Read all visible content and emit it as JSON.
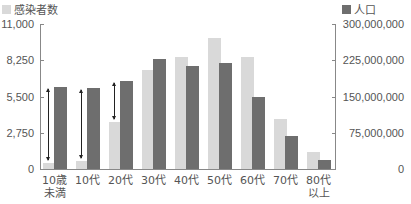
{
  "chart_data": {
    "type": "bar",
    "title": "",
    "xlabel": "",
    "ylabel_left": "",
    "ylabel_right": "",
    "categories": [
      "10歳\n未満",
      "10代",
      "20代",
      "30代",
      "40代",
      "50代",
      "60代",
      "70代",
      "80代\n以上"
    ],
    "series": [
      {
        "name": "感染者数",
        "axis": "left",
        "color": "#d9d9d9",
        "values": [
          450,
          600,
          3550,
          7500,
          8500,
          9950,
          8500,
          3800,
          1300
        ]
      },
      {
        "name": "人口",
        "axis": "right",
        "color": "#6e6e6e",
        "values": [
          170000000,
          168000000,
          182000000,
          228000000,
          213000000,
          219000000,
          149000000,
          68000000,
          19000000
        ]
      }
    ],
    "left_axis": {
      "ylim": [
        0,
        11000
      ],
      "ticks": [
        "0",
        "2,750",
        "5,500",
        "8,250",
        "11,000"
      ]
    },
    "right_axis": {
      "ylim": [
        0,
        300000000
      ],
      "ticks": [
        "0",
        "75,000,000",
        "150,000,000",
        "225,000,000",
        "300,000,000"
      ]
    },
    "annotations": [
      {
        "type": "double-arrow",
        "category": "10歳\n未満"
      },
      {
        "type": "double-arrow",
        "category": "10代"
      },
      {
        "type": "double-arrow",
        "category": "20代"
      }
    ],
    "legend": {
      "position": "top",
      "entries": [
        "感染者数",
        "人口"
      ]
    },
    "grid": false
  },
  "legend": {
    "left_label": "感染者数",
    "right_label": "人口"
  }
}
